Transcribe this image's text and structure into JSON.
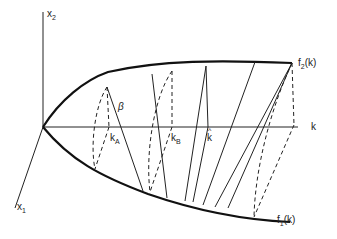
{
  "diagram": {
    "axes": {
      "x2": "x",
      "x2_sub": "2",
      "x1": "x",
      "x1_sub": "1",
      "k": "k"
    },
    "curves": {
      "upper": {
        "name": "f",
        "sub": "2",
        "arg": "(k)"
      },
      "lower": {
        "name": "f",
        "sub": "1",
        "arg": "(k)"
      }
    },
    "points": {
      "kA": {
        "name": "k",
        "sub": "A"
      },
      "kB": {
        "name": "k",
        "sub": "B"
      },
      "khat": {
        "name": "k",
        "hat": "^"
      }
    },
    "angle_label": "β"
  }
}
